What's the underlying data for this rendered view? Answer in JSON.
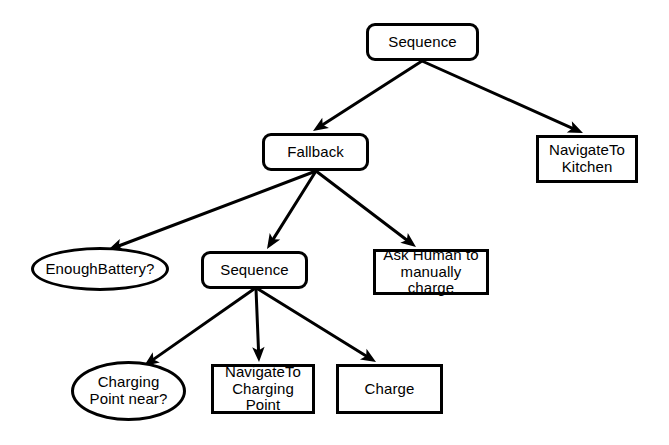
{
  "diagram": {
    "type": "behavior-tree",
    "background_color": "#ffffff",
    "stroke_color": "#000000",
    "text_color": "#000000",
    "nodes": [
      {
        "id": "root-sequence",
        "name": "node-sequence-root",
        "label": "Sequence",
        "node_kind": "control",
        "shape": "rounded-rectangle",
        "x": 366,
        "y": 23,
        "w": 113,
        "h": 38
      },
      {
        "id": "fallback",
        "name": "node-fallback",
        "label": "Fallback",
        "node_kind": "control",
        "shape": "rounded-rectangle",
        "x": 262,
        "y": 133,
        "w": 107,
        "h": 38
      },
      {
        "id": "navigate-kitchen",
        "name": "node-navigate-to-kitchen",
        "label": "NavigateTo\nKitchen",
        "node_kind": "action",
        "shape": "rectangle",
        "x": 536,
        "y": 135,
        "w": 102,
        "h": 48
      },
      {
        "id": "enough-battery",
        "name": "node-enough-battery",
        "label": "EnoughBattery?",
        "node_kind": "condition",
        "shape": "ellipse",
        "x": 31,
        "y": 247,
        "w": 138,
        "h": 44
      },
      {
        "id": "sub-sequence",
        "name": "node-sequence-charging",
        "label": "Sequence",
        "node_kind": "control",
        "shape": "rounded-rectangle",
        "x": 201,
        "y": 251,
        "w": 107,
        "h": 38
      },
      {
        "id": "ask-human",
        "name": "node-ask-human-to-manually-charge",
        "label": "Ask Human to\nmanually charge",
        "node_kind": "action",
        "shape": "rectangle",
        "x": 373,
        "y": 249,
        "w": 116,
        "h": 46
      },
      {
        "id": "charging-point-near",
        "name": "node-charging-point-near",
        "label": "Charging\nPoint near?",
        "node_kind": "condition",
        "shape": "ellipse",
        "x": 71,
        "y": 361,
        "w": 115,
        "h": 60
      },
      {
        "id": "navigate-charging-point",
        "name": "node-navigate-to-charging-point",
        "label": "NavigateTo\nCharging Point",
        "node_kind": "action",
        "shape": "rectangle",
        "x": 211,
        "y": 364,
        "w": 104,
        "h": 50
      },
      {
        "id": "charge",
        "name": "node-charge",
        "label": "Charge",
        "node_kind": "action",
        "shape": "rectangle",
        "x": 336,
        "y": 364,
        "w": 107,
        "h": 50
      }
    ],
    "edges": [
      {
        "id": "e1",
        "name": "edge-root-sequence-to-fallback",
        "from": "root-sequence",
        "to": "fallback",
        "x1": 422,
        "y1": 61,
        "x2": 313,
        "y2": 131,
        "arrow": true
      },
      {
        "id": "e2",
        "name": "edge-root-sequence-to-navigate-kitchen",
        "from": "root-sequence",
        "to": "navigate-kitchen",
        "x1": 422,
        "y1": 61,
        "x2": 583,
        "y2": 133,
        "arrow": true
      },
      {
        "id": "e3",
        "name": "edge-fallback-to-enough-battery",
        "from": "fallback",
        "to": "enough-battery",
        "x1": 316,
        "y1": 171,
        "x2": 108,
        "y2": 250,
        "arrow": true
      },
      {
        "id": "e4",
        "name": "edge-fallback-to-sequence",
        "from": "fallback",
        "to": "sub-sequence",
        "x1": 316,
        "y1": 171,
        "x2": 267,
        "y2": 249,
        "arrow": true
      },
      {
        "id": "e5",
        "name": "edge-fallback-to-ask-human",
        "from": "fallback",
        "to": "ask-human",
        "x1": 316,
        "y1": 171,
        "x2": 416,
        "y2": 247,
        "arrow": true
      },
      {
        "id": "e6",
        "name": "edge-sequence-to-charging-point-near",
        "from": "sub-sequence",
        "to": "charging-point-near",
        "x1": 254,
        "y1": 289,
        "x2": 144,
        "y2": 366,
        "arrow": true
      },
      {
        "id": "e7",
        "name": "edge-sequence-to-navigate-charging-point",
        "from": "sub-sequence",
        "to": "navigate-charging-point",
        "x1": 256,
        "y1": 289,
        "x2": 259,
        "y2": 362,
        "arrow": true
      },
      {
        "id": "e8",
        "name": "edge-sequence-to-charge",
        "from": "sub-sequence",
        "to": "charge",
        "x1": 258,
        "y1": 289,
        "x2": 376,
        "y2": 362,
        "arrow": true
      }
    ]
  }
}
